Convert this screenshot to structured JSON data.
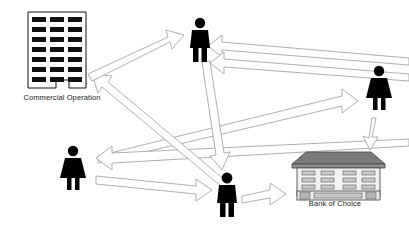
{
  "diagram": {
    "background_color": "#ffffff",
    "arrow_stroke_color": "#9a9a9a",
    "arrow_fill_color": "#ffffff",
    "figure_color": "#000000",
    "building_outline_color": "#4d4d4d",
    "bank_roof_color": "#6e6e6e",
    "bank_wall_color": "#f2f2f2",
    "nodes": [
      {
        "id": "commercial-operation",
        "label": "Commercial Operation",
        "type": "office-building",
        "window_rows": 7,
        "window_columns": 3,
        "x": 28,
        "y": 12
      },
      {
        "id": "person-top-male",
        "label": "",
        "type": "male-figure",
        "x": 188,
        "y": 18
      },
      {
        "id": "person-right-female",
        "label": "",
        "type": "female-figure",
        "x": 367,
        "y": 66
      },
      {
        "id": "person-left-female",
        "label": "",
        "type": "female-figure",
        "x": 63,
        "y": 146
      },
      {
        "id": "person-bottom-male",
        "label": "",
        "type": "male-figure",
        "x": 215,
        "y": 173
      },
      {
        "id": "bank-of-choice",
        "label": "Bank of Choice",
        "type": "bank-building",
        "window_rows": 3,
        "window_columns": 4,
        "x": 292,
        "y": 150
      }
    ],
    "edges": [
      {
        "id": "edge-commercial-to-top-male",
        "from": "commercial-operation",
        "to": "person-top-male",
        "direction": "forward"
      },
      {
        "id": "edge-bottom-male-to-commercial",
        "from": "person-bottom-male",
        "to": "commercial-operation",
        "direction": "forward"
      },
      {
        "id": "edge-right-female-to-top-male",
        "from": "person-right-female",
        "to": "person-top-male",
        "direction": "forward"
      },
      {
        "id": "edge-left-female-to-right-female",
        "from": "person-left-female",
        "to": "person-right-female",
        "direction": "forward"
      },
      {
        "id": "edge-right-side-to-left-female",
        "from": "person-right-female",
        "to": "person-left-female",
        "direction": "forward"
      },
      {
        "id": "edge-left-female-to-bottom-male",
        "from": "person-left-female",
        "to": "person-bottom-male",
        "direction": "forward"
      },
      {
        "id": "edge-top-male-to-bottom-male",
        "from": "person-top-male",
        "to": "person-bottom-male",
        "direction": "forward"
      },
      {
        "id": "edge-bottom-male-to-bank",
        "from": "person-bottom-male",
        "to": "bank-of-choice",
        "direction": "forward"
      },
      {
        "id": "edge-right-female-to-bank",
        "from": "person-right-female",
        "to": "bank-of-choice",
        "direction": "forward"
      }
    ]
  },
  "labels": {
    "commercial_operation": "Commercial Operation",
    "bank_of_choice": "Bank of Choice"
  }
}
